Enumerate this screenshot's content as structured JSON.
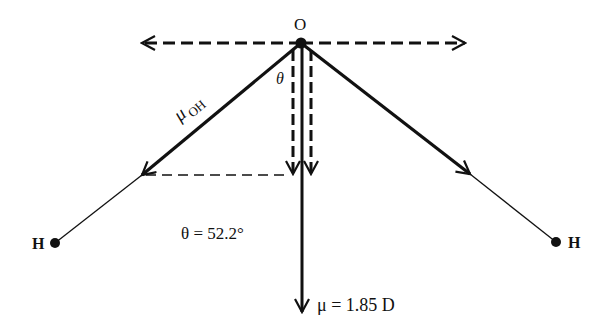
{
  "diagram": {
    "atoms": {
      "oxygen": {
        "label": "O",
        "x": 301,
        "y": 43
      },
      "hydrogen_left": {
        "label": "H",
        "x": 55,
        "y": 243
      },
      "hydrogen_right": {
        "label": "H",
        "x": 556,
        "y": 242
      }
    },
    "labels": {
      "bond_dipole": "μ",
      "bond_dipole_sub": "OH",
      "theta_symbol": "θ",
      "angle_value": "θ = 52.2°",
      "net_dipole": "μ = 1.85 D"
    },
    "colors": {
      "stroke": "#111111",
      "background": "#ffffff"
    }
  }
}
